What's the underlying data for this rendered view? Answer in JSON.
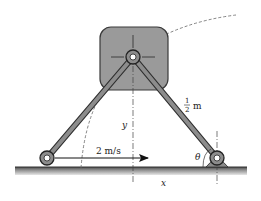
{
  "figure": {
    "type": "mechanism-diagram",
    "labels": {
      "velocity": "2 m/s",
      "link_length_num": "1",
      "link_length_den": "2",
      "link_length_unit": "m",
      "y_dim": "y",
      "x_dim": "x",
      "angle": "θ"
    },
    "colors": {
      "block_fill": "#9a9a9a",
      "block_stroke": "#3a3a3a",
      "link_fill": "#8c8c8c",
      "link_stroke": "#2e2e2e",
      "ground_top": "#555555",
      "ground_bottom": "#d8d8d8",
      "arrow": "#111111",
      "dashed": "#666666"
    }
  }
}
